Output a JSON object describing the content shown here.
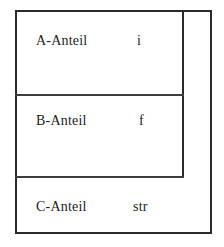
{
  "diagram": {
    "ink_color": "#2a2a2a",
    "background_color": "#ffffff",
    "rows": [
      {
        "label": "A-Anteil",
        "type": "i"
      },
      {
        "label": "B-Anteil",
        "type": "f"
      },
      {
        "label": "C-Anteil",
        "type": "str"
      }
    ]
  }
}
